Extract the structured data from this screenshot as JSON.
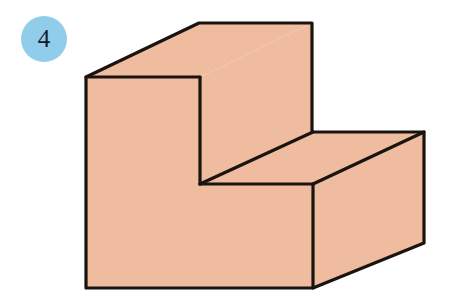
{
  "page": {
    "background_color": "#ffffff",
    "width": 459,
    "height": 305
  },
  "badge": {
    "label": "4",
    "fill_color": "#90cdeb",
    "text_color": "#131a2a",
    "shape": "circle",
    "diameter": 46,
    "x": 21,
    "y": 16
  },
  "figure": {
    "name": "isometric-stepped-solid",
    "fill_color": "#f0bc9f",
    "stroke_color": "#1a1410",
    "stroke_width": 3.2,
    "faces": [
      {
        "name": "front-face",
        "points": "86,77 200,77 200,184 313,184 313,288 86,288"
      },
      {
        "name": "top-face-upper-step",
        "points": "86,77 199,23 312,23 200,77"
      },
      {
        "name": "right-face-upper-step",
        "points": "200,77 312,23 312,132 200,184"
      },
      {
        "name": "top-face-lower-step",
        "points": "200,184 313,132 424,132 313,184"
      },
      {
        "name": "right-face-lower-step",
        "points": "313,184 424,132 424,243 313,288"
      }
    ],
    "edges": [
      {
        "name": "top-back-edge",
        "from": "199,23",
        "to": "312,23"
      },
      {
        "name": "top-left-slant-edge",
        "from": "86,77",
        "to": "199,23"
      },
      {
        "name": "top-front-edge-upper",
        "from": "86,77",
        "to": "200,77"
      },
      {
        "name": "upper-right-vertical-edge",
        "from": "312,23",
        "to": "312,132"
      },
      {
        "name": "inner-vertical-edge",
        "from": "200,77",
        "to": "200,184"
      },
      {
        "name": "inner-slant-edge",
        "from": "200,184",
        "to": "313,132"
      },
      {
        "name": "step-tread-front-edge",
        "from": "200,184",
        "to": "313,184"
      },
      {
        "name": "step-back-edge",
        "from": "313,132",
        "to": "424,132"
      },
      {
        "name": "lower-right-slant-edge",
        "from": "313,184",
        "to": "424,132"
      },
      {
        "name": "lower-right-vertical-edge",
        "from": "424,132",
        "to": "424,243"
      },
      {
        "name": "front-left-vertical-edge",
        "from": "86,77",
        "to": "86,288"
      },
      {
        "name": "front-bottom-edge",
        "from": "86,288",
        "to": "313,288"
      },
      {
        "name": "front-right-vertical-edge",
        "from": "313,184",
        "to": "313,288"
      },
      {
        "name": "bottom-right-slant-edge",
        "from": "313,288",
        "to": "424,243"
      }
    ]
  },
  "chart_data": {
    "type": "diagram",
    "title": "",
    "subtitle": "",
    "shape": "L-shaped stepped solid (two-step block)",
    "projection": "oblique / cabinet",
    "visible_faces": 5,
    "vertices_2d": [
      [
        86,
        77
      ],
      [
        199,
        23
      ],
      [
        312,
        23
      ],
      [
        200,
        77
      ],
      [
        312,
        132
      ],
      [
        424,
        132
      ],
      [
        313,
        184
      ],
      [
        200,
        184
      ],
      [
        424,
        243
      ],
      [
        313,
        288
      ],
      [
        86,
        288
      ]
    ],
    "labels": [
      "4"
    ],
    "legend": [],
    "annotations": []
  }
}
